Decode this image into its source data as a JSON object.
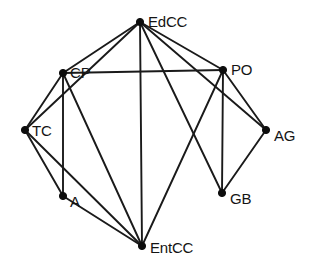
{
  "figure": {
    "type": "node-link-graph",
    "background_color": "#ffffff",
    "node_color": "#0d0d0d",
    "edge_color": "#1a1a1a",
    "label_color": "#141414",
    "width": 311,
    "height": 275
  },
  "chart_data": {
    "type": "diagram",
    "diagram_kind": "undirected-network-graph",
    "title": "",
    "node_count": 8,
    "edge_count": 17,
    "nodes": [
      {
        "id": "EdCC",
        "label": "EdCC",
        "x": 140,
        "y": 22,
        "label_dx": 8,
        "label_dy": -8
      },
      {
        "id": "CP",
        "label": "CP",
        "x": 63,
        "y": 73,
        "label_dx": 7,
        "label_dy": -8
      },
      {
        "id": "PO",
        "label": "PO",
        "x": 223,
        "y": 70,
        "label_dx": 8,
        "label_dy": -8
      },
      {
        "id": "TC",
        "label": "TC",
        "x": 25,
        "y": 130,
        "label_dx": 7,
        "label_dy": -7
      },
      {
        "id": "AG",
        "label": "AG",
        "x": 266,
        "y": 130,
        "label_dx": 8,
        "label_dy": -2
      },
      {
        "id": "A",
        "label": "A",
        "x": 63,
        "y": 196,
        "label_dx": 7,
        "label_dy": -2
      },
      {
        "id": "GB",
        "label": "GB",
        "x": 222,
        "y": 193,
        "label_dx": 8,
        "label_dy": -2
      },
      {
        "id": "EntCC",
        "label": "EntCC",
        "x": 142,
        "y": 246,
        "label_dx": 8,
        "label_dy": -6
      }
    ],
    "edges": [
      {
        "source": "EdCC",
        "target": "CP"
      },
      {
        "source": "EdCC",
        "target": "TC"
      },
      {
        "source": "EdCC",
        "target": "PO"
      },
      {
        "source": "EdCC",
        "target": "AG"
      },
      {
        "source": "EdCC",
        "target": "GB"
      },
      {
        "source": "EdCC",
        "target": "EntCC"
      },
      {
        "source": "CP",
        "target": "PO"
      },
      {
        "source": "CP",
        "target": "TC"
      },
      {
        "source": "CP",
        "target": "A"
      },
      {
        "source": "CP",
        "target": "EntCC"
      },
      {
        "source": "TC",
        "target": "A"
      },
      {
        "source": "TC",
        "target": "EntCC"
      },
      {
        "source": "A",
        "target": "EntCC"
      },
      {
        "source": "PO",
        "target": "AG"
      },
      {
        "source": "PO",
        "target": "GB"
      },
      {
        "source": "PO",
        "target": "EntCC"
      },
      {
        "source": "AG",
        "target": "GB"
      }
    ]
  }
}
